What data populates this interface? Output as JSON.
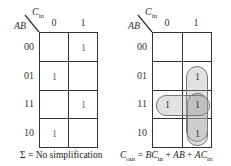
{
  "left_map": {
    "row_var": "AB",
    "col_var": "C",
    "col_var_sub": "in",
    "col_labels": [
      "0",
      "1"
    ],
    "row_labels": [
      "00",
      "01",
      "11",
      "10"
    ],
    "cells": [
      [
        "",
        "1"
      ],
      [
        "1",
        ""
      ],
      [
        "",
        "1"
      ],
      [
        "1",
        ""
      ]
    ],
    "caption": "Σ = No simplification"
  },
  "right_map": {
    "row_var": "AB",
    "col_var": "C",
    "col_var_sub": "in",
    "col_labels": [
      "0",
      "1"
    ],
    "row_labels": [
      "00",
      "01",
      "11",
      "10"
    ],
    "cells": [
      [
        "",
        ""
      ],
      [
        "",
        "1"
      ],
      [
        "1",
        "1"
      ],
      [
        "",
        "1"
      ]
    ],
    "groups": [
      {
        "name": "BCin",
        "cells": "rows 01-11, col 1"
      },
      {
        "name": "AB",
        "cells": "row 11, cols 0-1"
      },
      {
        "name": "ACin",
        "cells": "rows 11-10, col 1"
      }
    ],
    "caption": {
      "lhs": "C",
      "lhs_sub": "out",
      "eq": " = ",
      "t1": "BC",
      "t1_sub": "in",
      "plus1": " + ",
      "t2": "AB",
      "plus2": " + ",
      "t3": "AC",
      "t3_sub": "in"
    }
  }
}
